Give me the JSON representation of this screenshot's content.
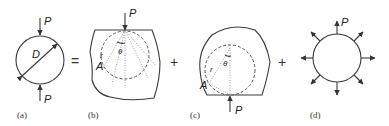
{
  "figure": {
    "panels": [
      {
        "id": "a",
        "caption": "(a)",
        "labels": {
          "force": "P",
          "force_bottom": "P",
          "diameter": "D"
        }
      },
      {
        "id": "b",
        "caption": "(b)",
        "labels": {
          "force": "P",
          "radius": "r",
          "angle": "θ",
          "point": "A"
        }
      },
      {
        "id": "c",
        "caption": "(c)",
        "labels": {
          "force": "P",
          "radius": "r",
          "angle": "θ",
          "point": "A"
        }
      },
      {
        "id": "d",
        "caption": "(d)",
        "labels": {
          "force": "P"
        }
      }
    ],
    "operators": [
      "=",
      "+",
      "+"
    ],
    "subscripts": {
      "b_r": "1",
      "b_theta": "1",
      "c_r": "1",
      "c_theta": "1"
    }
  }
}
